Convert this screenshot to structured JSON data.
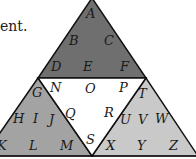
{
  "text_fragment": "ent.",
  "colors": {
    "top_triangle": "#6f6f6f",
    "bottom_left_triangle": "#a3a3a3",
    "bottom_right_triangle": "#c9c9c9",
    "center_triangle": "#ffffff",
    "stroke": "#111111"
  },
  "regions": {
    "top": {
      "letters": [
        "A",
        "B",
        "C",
        "D",
        "E",
        "F"
      ]
    },
    "center": {
      "letters": [
        "N",
        "O",
        "P",
        "Q",
        "R",
        "S"
      ]
    },
    "bottom_left": {
      "letters": [
        "G",
        "H",
        "I",
        "J",
        "K",
        "L",
        "M"
      ]
    },
    "bottom_right": {
      "letters": [
        "T",
        "U",
        "V",
        "W",
        "X",
        "Y",
        "Z"
      ]
    }
  },
  "labels": {
    "A": "A",
    "B": "B",
    "C": "C",
    "D": "D",
    "E": "E",
    "F": "F",
    "G": "G",
    "H": "H",
    "I": "I",
    "J": "J",
    "K": "K",
    "L": "L",
    "M": "M",
    "N": "N",
    "O": "O",
    "P": "P",
    "Q": "Q",
    "R": "R",
    "S": "S",
    "T": "T",
    "U": "U",
    "V": "V",
    "W": "W",
    "X": "X",
    "Y": "Y",
    "Z": "Z"
  }
}
